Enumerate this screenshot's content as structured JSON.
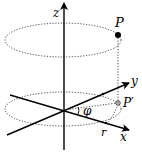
{
  "diagram": {
    "type": "cylindrical-coordinates",
    "axes": {
      "z": "z",
      "y": "y",
      "x": "x"
    },
    "points": {
      "P": "P",
      "P_prime": "P′"
    },
    "annotations": {
      "radius": "r",
      "angle": "φ"
    },
    "colors": {
      "stroke": "#000000",
      "dotted": "#333333",
      "background": "#ffffff"
    }
  }
}
